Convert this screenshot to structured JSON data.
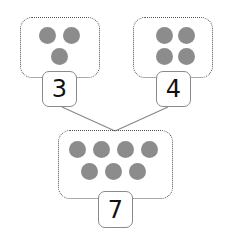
{
  "diagram": {
    "type": "number-bond",
    "left": {
      "count": 3,
      "label": "3"
    },
    "right": {
      "count": 4,
      "label": "4"
    },
    "total": {
      "count": 7,
      "label": "7"
    }
  },
  "colors": {
    "dot": "#8c8c8c",
    "border": "#555555",
    "line": "#888888"
  }
}
